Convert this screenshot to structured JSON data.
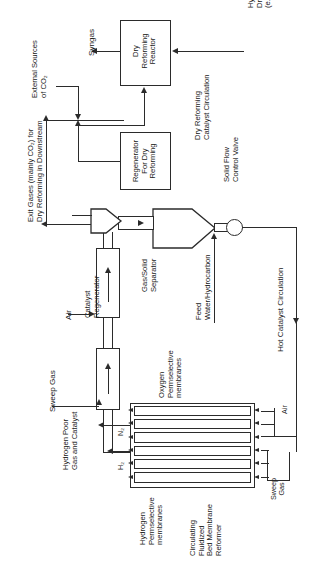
{
  "diagram": {
    "orientation": "rotated-90",
    "ink_color": "#2b2b2b",
    "background": "#ffffff"
  },
  "units": {
    "dry_reforming_reactor": "Dry\nReforming\nReactor",
    "dry_reforming_reactor_l1": "Dry",
    "dry_reforming_reactor_l2": "Reforming",
    "dry_reforming_reactor_l3": "Reactor",
    "regenerator_l1": "Regenerator",
    "regenerator_l2": "For Dry",
    "regenerator_l3": "Reforming",
    "catalyst_regenerator_l1": "Catalyst",
    "catalyst_regenerator_l2": "Regenerator",
    "external_hydrogen_separator_l1": "External",
    "external_hydrogen_separator_l2": "Hydrogen",
    "external_hydrogen_separator_l3": "Separator",
    "gas_solid_separator_l1": "Gas/Solid",
    "gas_solid_separator_l2": "Separator",
    "cfbmr_l1": "Circulating",
    "cfbmr_l2": "Fluidized",
    "cfbmr_l3": "Bed Membrane",
    "cfbmr_l4": "Reformer"
  },
  "streams": {
    "syngas": "Syngas",
    "external_sources_co2_l1": "External Sources",
    "external_sources_co2_l2": "of CO₂",
    "exit_gases_l1": "Exit Gases (mainly CO₂) for",
    "exit_gases_l2": "Dry Reforming in Downstream",
    "hydrocarbon_l1": "Hydrocarbon for",
    "hydrocarbon_l2": "Dry Reforming",
    "hydrocarbon_l3": "(e.g., Natural Gas)",
    "dry_reforming_catalyst_circulation_l1": "Dry Reforming",
    "dry_reforming_catalyst_circulation_l2": "Catalyst Circulation",
    "solid_flow_control_valve_l1": "Solid Flow",
    "solid_flow_control_valve_l2": "Control Valve",
    "feed_l1": "Feed",
    "feed_l2": "Water/Hydrocarbon",
    "hot_catalyst_circulation": "Hot Catalyst Circulation",
    "air_left": "Air",
    "air_right": "Air",
    "sweep_gas_left": "Sweep Gas",
    "sweep_gas_right_l1": "Sweep",
    "sweep_gas_right_l2": "Gas",
    "hydrogen_poor_l1": "Hydrogen Poor",
    "hydrogen_poor_l2": "Gas and Catalyst",
    "n2": "N₂",
    "h2": "H₂",
    "oxygen_membranes_l1": "Oxygen",
    "oxygen_membranes_l2": "Permselective",
    "oxygen_membranes_l3": "membranes",
    "hydrogen_membranes_l1": "Hydrogen",
    "hydrogen_membranes_l2": "Permselective",
    "hydrogen_membranes_l3": "membranes"
  }
}
